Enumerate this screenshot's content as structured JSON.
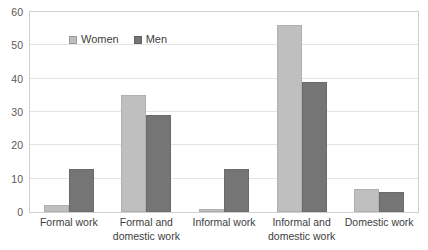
{
  "chart_data": {
    "type": "bar",
    "title": "",
    "subtitle": "",
    "xlabel": "",
    "ylabel": "",
    "categories": [
      "Formal work",
      "Formal and domestic work",
      "Informal work",
      "Informal and domestic work",
      "Domestic work"
    ],
    "category_lines": [
      [
        "Formal work"
      ],
      [
        "Formal and",
        "domestic work"
      ],
      [
        "Informal work"
      ],
      [
        "Informal and",
        "domestic work"
      ],
      [
        "Domestic work"
      ]
    ],
    "series": [
      {
        "name": "Women",
        "color": "#BFBFBF",
        "values": [
          2,
          35,
          1,
          56,
          7
        ]
      },
      {
        "name": "Men",
        "color": "#757575",
        "values": [
          13,
          29,
          13,
          39,
          6
        ]
      }
    ],
    "ylim": [
      0,
      60
    ],
    "yticks": [
      0,
      10,
      20,
      30,
      40,
      50,
      60
    ],
    "ytick_labels": [
      "0",
      "10",
      "20",
      "30",
      "40",
      "50",
      "60"
    ],
    "grid": "horizontal",
    "legend_position": "top-left-inside",
    "plot_border_color": "#D0D0D0",
    "gridline_color": "#E4E4E4",
    "background": "#FFFFFF"
  },
  "legend": {
    "entries": [
      {
        "label": "Women"
      },
      {
        "label": "Men"
      }
    ]
  }
}
